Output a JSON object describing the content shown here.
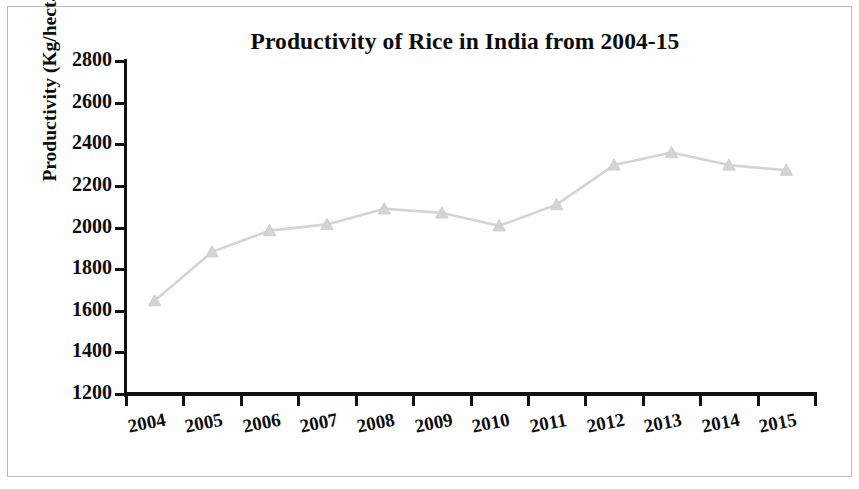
{
  "chart_data": {
    "type": "line",
    "title": "Productivity of Rice in India from 2004-15",
    "xlabel": "",
    "ylabel": "Productivity (Kg/hectare)",
    "categories": [
      "2004",
      "2005",
      "2006",
      "2007",
      "2008",
      "2009",
      "2010",
      "2011",
      "2012",
      "2013",
      "2014",
      "2015"
    ],
    "values": [
      1648,
      1883,
      1985,
      2015,
      2090,
      2070,
      2008,
      2110,
      2300,
      2360,
      2300,
      2275
    ],
    "series": [
      {
        "name": "Productivity (Kg/hectare)",
        "values": [
          1648,
          1883,
          1985,
          2015,
          2090,
          2070,
          2008,
          2110,
          2300,
          2360,
          2300,
          2275
        ]
      }
    ],
    "ylim": [
      1200,
      2800
    ],
    "ytick_labels": [
      "2800",
      "2600",
      "2400",
      "2200",
      "2000",
      "1800",
      "1600",
      "1400",
      "1200"
    ],
    "ytick_values": [
      2800,
      2600,
      2400,
      2200,
      2000,
      1800,
      1600,
      1400,
      1200
    ],
    "grid": false,
    "legend": "none",
    "marker": "triangle",
    "series_color": "#d4d4d4",
    "axis_color": "#111111",
    "text_color": "#0d0d0d"
  },
  "figure": {
    "title": "Productivity of Rice in India from 2004-15",
    "ylabel": "Productivity (Kg/hectare)",
    "border_color": "#b9b9b9",
    "background": "#fefefe"
  }
}
